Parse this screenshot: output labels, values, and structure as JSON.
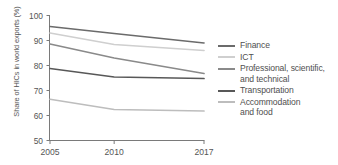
{
  "chart_data": {
    "type": "line",
    "title": "",
    "xlabel": "",
    "ylabel": "Share of HICs in world exports (%)",
    "x": [
      2005,
      2010,
      2017
    ],
    "categories": [
      "2005",
      "2010",
      "2017"
    ],
    "xtick_labels": [
      "2005",
      "2010",
      "2017"
    ],
    "ytick_labels": [
      "100",
      "90",
      "80",
      "70",
      "60",
      "50"
    ],
    "yticks": [
      100,
      90,
      80,
      70,
      60,
      50
    ],
    "ylim": [
      50,
      100
    ],
    "xlim": [
      2005,
      2017
    ],
    "grid": false,
    "legend_position": "right",
    "series": [
      {
        "name": "Finance",
        "values": [
          95.6,
          92.8,
          89.0
        ],
        "color": "#6b6b6b"
      },
      {
        "name": "ICT",
        "values": [
          93.0,
          88.4,
          86.0
        ],
        "color": "#cfcfcf"
      },
      {
        "name": "Professional, scientific,\nand technical",
        "values": [
          88.6,
          83.0,
          76.8
        ],
        "color": "#8a8a8a"
      },
      {
        "name": "Transportation",
        "values": [
          78.8,
          75.4,
          74.8
        ],
        "color": "#585858"
      },
      {
        "name": "Accommodation\nand food",
        "values": [
          66.5,
          62.4,
          61.8
        ],
        "color": "#bdbdbd"
      }
    ]
  },
  "axis": {
    "line_color": "#7a7a7a"
  }
}
